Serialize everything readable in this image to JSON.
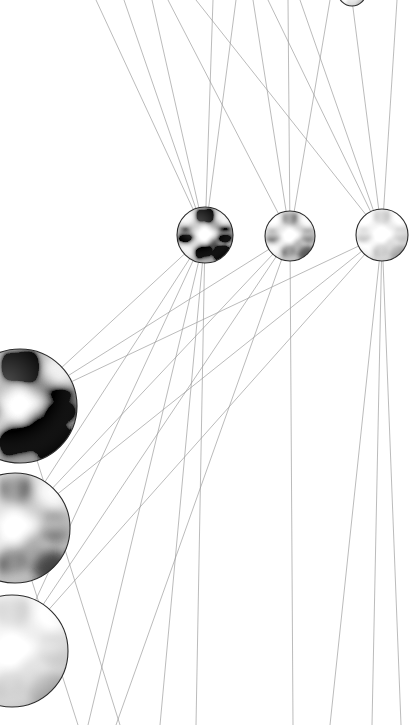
{
  "canvas": {
    "width": 409,
    "height": 725,
    "background_color": "#ffffff",
    "title": "neural-network-node-graph"
  },
  "style": {
    "edge_color": "#9a9a9a",
    "edge_color_faint": "#bcbcbc",
    "edge_width": 0.8,
    "node_outline_color": "#2b2b2b",
    "node_outline_width": 1.1
  },
  "chart_data": {
    "type": "scatter",
    "title": "",
    "xlabel": "",
    "ylabel": "",
    "grid": false,
    "legend": "none",
    "nodes": [
      {
        "id": "small-node-1",
        "group": "upper-row",
        "cx": 205,
        "cy": 235,
        "r": 28,
        "brightness": 0.34,
        "contrast": 1.55,
        "label": ""
      },
      {
        "id": "small-node-2",
        "group": "upper-row",
        "cx": 290,
        "cy": 236,
        "r": 25,
        "brightness": 0.62,
        "contrast": 1.0,
        "label": ""
      },
      {
        "id": "small-node-3",
        "group": "upper-row",
        "cx": 382,
        "cy": 235,
        "r": 26,
        "brightness": 0.82,
        "contrast": 0.58,
        "label": ""
      },
      {
        "id": "large-node-1",
        "group": "left-column",
        "cx": 20,
        "cy": 406,
        "r": 57,
        "brightness": 0.2,
        "contrast": 1.85,
        "label": ""
      },
      {
        "id": "large-node-2",
        "group": "left-column",
        "cx": 15,
        "cy": 528,
        "r": 55,
        "brightness": 0.58,
        "contrast": 1.05,
        "label": ""
      },
      {
        "id": "large-node-3",
        "group": "left-column",
        "cx": 12,
        "cy": 651,
        "r": 56,
        "brightness": 0.84,
        "contrast": 0.5,
        "label": ""
      },
      {
        "id": "faint-node-top",
        "group": "offscreen-top",
        "cx": 352,
        "cy": -8,
        "r": 14,
        "brightness": 0.94,
        "contrast": 0.3,
        "label": ""
      }
    ],
    "edges": [
      {
        "x1": 205,
        "y1": 235,
        "x2": 96,
        "y2": 0
      },
      {
        "x1": 205,
        "y1": 235,
        "x2": 124,
        "y2": 0
      },
      {
        "x1": 205,
        "y1": 235,
        "x2": 152,
        "y2": 0
      },
      {
        "x1": 205,
        "y1": 235,
        "x2": 213,
        "y2": 0
      },
      {
        "x1": 205,
        "y1": 235,
        "x2": 236,
        "y2": 0
      },
      {
        "x1": 290,
        "y1": 236,
        "x2": 168,
        "y2": 0
      },
      {
        "x1": 290,
        "y1": 236,
        "x2": 253,
        "y2": 0
      },
      {
        "x1": 290,
        "y1": 236,
        "x2": 288,
        "y2": 0
      },
      {
        "x1": 290,
        "y1": 236,
        "x2": 330,
        "y2": 0
      },
      {
        "x1": 382,
        "y1": 235,
        "x2": 196,
        "y2": 0
      },
      {
        "x1": 382,
        "y1": 235,
        "x2": 268,
        "y2": 0
      },
      {
        "x1": 382,
        "y1": 235,
        "x2": 300,
        "y2": 0
      },
      {
        "x1": 382,
        "y1": 235,
        "x2": 352,
        "y2": 0
      },
      {
        "x1": 382,
        "y1": 235,
        "x2": 397,
        "y2": 0
      },
      {
        "x1": 205,
        "y1": 235,
        "x2": 20,
        "y2": 406
      },
      {
        "x1": 205,
        "y1": 235,
        "x2": 15,
        "y2": 528
      },
      {
        "x1": 205,
        "y1": 235,
        "x2": 12,
        "y2": 651
      },
      {
        "x1": 290,
        "y1": 236,
        "x2": 20,
        "y2": 406
      },
      {
        "x1": 290,
        "y1": 236,
        "x2": 15,
        "y2": 528
      },
      {
        "x1": 290,
        "y1": 236,
        "x2": 12,
        "y2": 651
      },
      {
        "x1": 382,
        "y1": 235,
        "x2": 20,
        "y2": 406
      },
      {
        "x1": 382,
        "y1": 235,
        "x2": 15,
        "y2": 528
      },
      {
        "x1": 382,
        "y1": 235,
        "x2": 12,
        "y2": 651
      },
      {
        "x1": 205,
        "y1": 235,
        "x2": 160,
        "y2": 725
      },
      {
        "x1": 205,
        "y1": 235,
        "x2": 196,
        "y2": 725
      },
      {
        "x1": 205,
        "y1": 235,
        "x2": 88,
        "y2": 725
      },
      {
        "x1": 290,
        "y1": 236,
        "x2": 293,
        "y2": 725
      },
      {
        "x1": 290,
        "y1": 236,
        "x2": 116,
        "y2": 725
      },
      {
        "x1": 382,
        "y1": 235,
        "x2": 330,
        "y2": 725
      },
      {
        "x1": 382,
        "y1": 235,
        "x2": 372,
        "y2": 725
      },
      {
        "x1": 382,
        "y1": 235,
        "x2": 401,
        "y2": 725
      },
      {
        "x1": 20,
        "y1": 406,
        "x2": 120,
        "y2": 725
      },
      {
        "x1": 15,
        "y1": 528,
        "x2": 78,
        "y2": 725
      }
    ],
    "edge_count": 33,
    "node_count": 7
  }
}
